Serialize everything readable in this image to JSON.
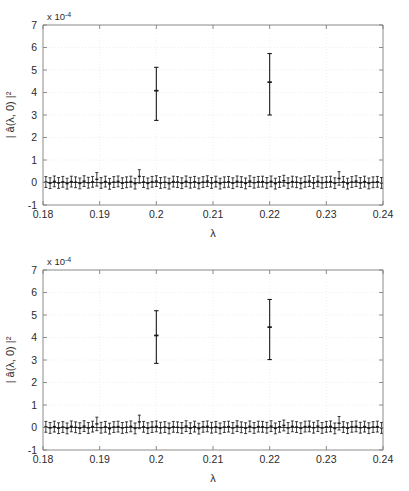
{
  "figure": {
    "name": "dual-panel-errorbar-spectrum",
    "panel_count": 2,
    "background": "#ffffff",
    "data_color": "#1a1a1a",
    "grid_color": "#e8e8e8",
    "axis_color": "#808080"
  },
  "chart_data": [
    {
      "type": "scatter",
      "panel": "top",
      "title": "",
      "xlabel": "λ",
      "ylabel": "| â(λ, 0) |²",
      "y_exponent_label": "x 10",
      "y_exponent_sup": "-4",
      "xlim": [
        0.18,
        0.24
      ],
      "ylim": [
        -1,
        7
      ],
      "xticks": [
        0.18,
        0.19,
        0.2,
        0.21,
        0.22,
        0.23,
        0.24
      ],
      "xticklabels": [
        "0.18",
        "0.19",
        "0.2",
        "0.21",
        "0.22",
        "0.23",
        "0.24"
      ],
      "yticks": [
        -1,
        0,
        1,
        2,
        3,
        4,
        5,
        6,
        7
      ],
      "yticklabels": [
        "-1",
        "0",
        "1",
        "2",
        "3",
        "4",
        "5",
        "6",
        "7"
      ],
      "grid": true,
      "legend": "none",
      "errorbar": true,
      "series": [
        {
          "name": "peaks",
          "x": [
            0.2,
            0.22
          ],
          "values": [
            4.08,
            4.46
          ],
          "err_low": [
            1.32,
            1.46
          ],
          "err_high": [
            1.04,
            1.27
          ]
        },
        {
          "name": "baseline-noise",
          "x_start": 0.1805,
          "x_step": 0.00075,
          "n_points": 80,
          "values": [
            0.02,
            -0.03,
            0.05,
            -0.02,
            0.03,
            -0.05,
            0.04,
            0.01,
            -0.04,
            0.06,
            -0.01,
            0.03,
            0.14,
            -0.02,
            0.04,
            -0.06,
            0.02,
            0.05,
            -0.03,
            0.01,
            0.04,
            -0.05,
            0.27,
            0.02,
            -0.04,
            0.03,
            0.06,
            -0.02,
            0.01,
            -0.05,
            0.04,
            0.02,
            -0.03,
            0.05,
            -0.01,
            0.03,
            -0.04,
            0.02,
            0.06,
            -0.02,
            0.04,
            -0.05,
            0.01,
            0.03,
            -0.03,
            0.05,
            0.02,
            -0.04,
            0.06,
            -0.01,
            0.03,
            0.04,
            -0.02,
            0.05,
            -0.05,
            0.02,
            0.08,
            -0.03,
            0.04,
            0.01,
            -0.04,
            0.03,
            0.06,
            -0.02,
            0.05,
            -0.01,
            0.02,
            0.04,
            -0.03,
            0.18,
            0.03,
            -0.05,
            0.02,
            0.06,
            -0.02,
            0.04,
            -0.04,
            0.01,
            0.03,
            -0.02
          ],
          "err_typical": 0.24
        }
      ]
    },
    {
      "type": "scatter",
      "panel": "bottom",
      "title": "",
      "xlabel": "λ",
      "ylabel": "| â(λ, 0) |²",
      "y_exponent_label": "x 10",
      "y_exponent_sup": "-4",
      "xlim": [
        0.18,
        0.24
      ],
      "ylim": [
        -1,
        7
      ],
      "xticks": [
        0.18,
        0.19,
        0.2,
        0.21,
        0.22,
        0.23,
        0.24
      ],
      "xticklabels": [
        "0.18",
        "0.19",
        "0.2",
        "0.21",
        "0.22",
        "0.23",
        "0.24"
      ],
      "yticks": [
        -1,
        0,
        1,
        2,
        3,
        4,
        5,
        6,
        7
      ],
      "yticklabels": [
        "-1",
        "0",
        "1",
        "2",
        "3",
        "4",
        "5",
        "6",
        "7"
      ],
      "grid": true,
      "legend": "none",
      "errorbar": true,
      "series": [
        {
          "name": "peaks",
          "x": [
            0.2,
            0.22
          ],
          "values": [
            4.09,
            4.46
          ],
          "err_low": [
            1.24,
            1.44
          ],
          "err_high": [
            1.1,
            1.23
          ]
        },
        {
          "name": "baseline-noise",
          "x_start": 0.1805,
          "x_step": 0.00075,
          "n_points": 80,
          "values": [
            0.03,
            -0.02,
            0.04,
            -0.03,
            0.02,
            -0.04,
            0.05,
            0.01,
            -0.03,
            0.06,
            -0.02,
            0.04,
            0.16,
            -0.01,
            0.03,
            -0.05,
            0.02,
            0.04,
            -0.02,
            0.01,
            0.05,
            -0.04,
            0.25,
            0.03,
            -0.03,
            0.02,
            0.05,
            -0.01,
            0.02,
            -0.04,
            0.03,
            0.01,
            -0.02,
            0.06,
            -0.03,
            0.04,
            -0.05,
            0.03,
            0.05,
            -0.01,
            0.03,
            -0.04,
            0.02,
            0.04,
            -0.02,
            0.06,
            0.01,
            -0.03,
            0.05,
            -0.02,
            0.04,
            0.03,
            -0.01,
            0.06,
            -0.04,
            0.03,
            0.09,
            -0.02,
            0.05,
            0.02,
            -0.03,
            0.04,
            0.05,
            -0.01,
            0.06,
            -0.02,
            0.03,
            0.05,
            -0.04,
            0.19,
            0.02,
            -0.03,
            0.03,
            0.05,
            -0.01,
            0.04,
            -0.03,
            0.02,
            0.04,
            -0.02
          ],
          "err_typical": 0.24
        }
      ]
    }
  ]
}
